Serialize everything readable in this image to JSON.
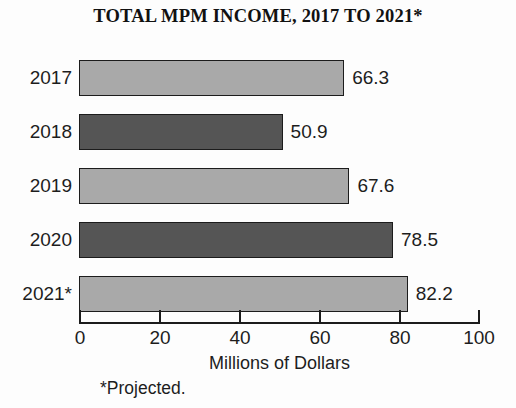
{
  "chart_data": {
    "type": "bar",
    "orientation": "horizontal",
    "title": "TOTAL MPM INCOME, 2017 TO 2021*",
    "xlabel": "Millions of Dollars",
    "ylabel": "",
    "xlim": [
      0,
      100
    ],
    "grid": false,
    "legend": null,
    "footnote": "*Projected.",
    "categories": [
      "2017",
      "2018",
      "2019",
      "2020",
      "2021*"
    ],
    "values": [
      66.3,
      50.9,
      67.6,
      78.5,
      82.2
    ],
    "value_labels": [
      "66.3",
      "50.9",
      "67.6",
      "78.5",
      "82.2"
    ],
    "bar_colors": [
      "#a9a9a9",
      "#555555",
      "#a9a9a9",
      "#555555",
      "#a9a9a9"
    ],
    "bar_border_color": "#1c1c1c",
    "xticks": [
      0,
      20,
      40,
      60,
      80,
      100
    ],
    "xtick_labels": [
      "0",
      "20",
      "40",
      "60",
      "80",
      "100"
    ],
    "bars": [
      {
        "category": "2017",
        "value": 66.3,
        "label": "66.3",
        "shade": "light"
      },
      {
        "category": "2018",
        "value": 50.9,
        "label": "50.9",
        "shade": "dark"
      },
      {
        "category": "2019",
        "value": 67.6,
        "label": "67.6",
        "shade": "light"
      },
      {
        "category": "2020",
        "value": 78.5,
        "label": "78.5",
        "shade": "dark"
      },
      {
        "category": "2021*",
        "value": 82.2,
        "label": "82.2",
        "shade": "light"
      }
    ]
  },
  "colors": {
    "background": "#fdfdfd",
    "ink": "#1c1c1c",
    "light_bar": "#a9a9a9",
    "dark_bar": "#555555"
  }
}
